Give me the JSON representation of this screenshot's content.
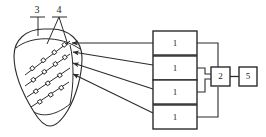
{
  "figure": {
    "background_color": "#ffffff",
    "line_color": "#2b2b2b",
    "organ": {
      "name": "leaf-shaped-organ-outline",
      "reference_number": "3",
      "description": "tapered leaf/heart shaped outline at left"
    },
    "electrode_arrays": {
      "name": "electrode-array",
      "reference_number": "4",
      "count": 4,
      "beads_per_array": [
        4,
        4,
        3,
        3
      ],
      "description": "diagonal electrode strings with bead markers inside the organ"
    },
    "channel_blocks": [
      {
        "label": "1",
        "name": "channel-block-1"
      },
      {
        "label": "1",
        "name": "channel-block-2"
      },
      {
        "label": "1",
        "name": "channel-block-3"
      },
      {
        "label": "1",
        "name": "channel-block-4"
      }
    ],
    "processor_block": {
      "label": "2",
      "name": "processor-block"
    },
    "output_block": {
      "label": "5",
      "name": "output-block"
    },
    "callouts": [
      {
        "label": "3",
        "name": "callout-3",
        "leader": "single-vertical"
      },
      {
        "label": "4",
        "name": "callout-4",
        "leader": "double-branch"
      }
    ],
    "connections": {
      "organ_to_channels": 4,
      "channels_to_processor": 4,
      "processor_to_output": 1
    }
  }
}
